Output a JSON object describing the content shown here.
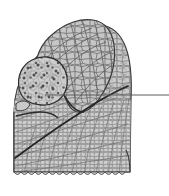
{
  "figure": {
    "type": "scientific-line-drawing",
    "background_color": "#ffffff",
    "canvas": {
      "width": 169,
      "height": 196
    }
  },
  "colors": {
    "background": "#ffffff",
    "plate_fill": "#c9c9c9",
    "plate_fill_light": "#d6d6d6",
    "plate_fill_dark": "#b8b8b8",
    "plate_stroke": "#6e6e6e",
    "outline": "#3a3a3a",
    "suture": "#2b2b2b",
    "tubercle": "#555555",
    "leader_line": "#5a5a5a"
  },
  "specimen": {
    "name": "fossil-specimen",
    "description": "Rounded triangular plated body with overlapping upper lobe, tuberculate nodule at upper left, diagonal suture and scalloped basal margin",
    "parts": [
      {
        "id": "upper-lobe",
        "label": "upper lobe",
        "texture": "polygonal-plates"
      },
      {
        "id": "main-body",
        "label": "main body",
        "texture": "polygonal-plates"
      },
      {
        "id": "nodule",
        "label": "tuberculate nodule",
        "texture": "pitted-tubercles"
      },
      {
        "id": "diagonal-suture",
        "label": "diagonal suture",
        "texture": "line"
      },
      {
        "id": "basal-margin",
        "label": "scalloped basal margin",
        "texture": "crenulate"
      }
    ]
  },
  "annotation": {
    "leader_line": {
      "name": "leader-line",
      "label": "",
      "x1": 45,
      "y1": 95,
      "x2": 169,
      "y2": 95,
      "width": 1
    }
  },
  "chart_data": {
    "type": "table",
    "xlabel": "",
    "ylabel": "",
    "categories": [
      "upper-lobe",
      "main-body",
      "nodule",
      "diagonal-suture",
      "basal-margin",
      "leader-line"
    ],
    "values": [
      1,
      1,
      1,
      1,
      1,
      1
    ]
  }
}
